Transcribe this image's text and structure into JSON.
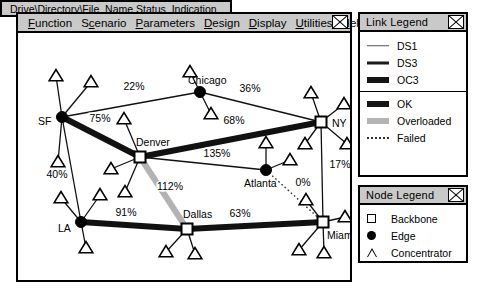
{
  "app": {
    "menu": [
      {
        "label": "Function",
        "accel": "F"
      },
      {
        "label": "Scenario",
        "accel": "c"
      },
      {
        "label": "Parameters",
        "accel": "P"
      },
      {
        "label": "Design",
        "accel": "D"
      },
      {
        "label": "Display",
        "accel": "D"
      },
      {
        "label": "Utilities",
        "accel": "U"
      },
      {
        "label": "Help",
        "accel": "H"
      }
    ],
    "close_icon": "close-x-icon"
  },
  "statusbar": {
    "text": "Drive\\Directory\\File_Name  Status_Indication"
  },
  "link_legend": {
    "title": "Link Legend",
    "close_icon": "close-x-icon",
    "capacity_items": [
      {
        "label": "DS1",
        "style": "ds1",
        "color": "#555555"
      },
      {
        "label": "DS3",
        "style": "ds3",
        "color": "#1a1a1a"
      },
      {
        "label": "OC3",
        "style": "oc3",
        "color": "#151515"
      }
    ],
    "status_items": [
      {
        "label": "OK",
        "style": "ok",
        "color": "#151515"
      },
      {
        "label": "Overloaded",
        "style": "over",
        "color": "#b3b3b3"
      },
      {
        "label": "Failed",
        "style": "fail",
        "color": "#333333"
      }
    ]
  },
  "node_legend": {
    "title": "Node Legend",
    "close_icon": "close-x-icon",
    "items": [
      {
        "label": "Backbone",
        "shape": "square",
        "icon": "square-node-icon"
      },
      {
        "label": "Edge",
        "shape": "circle",
        "icon": "circle-node-icon"
      },
      {
        "label": "Concentrator",
        "shape": "triangle",
        "icon": "triangle-node-icon"
      }
    ]
  },
  "network": {
    "nodes": [
      {
        "id": "sf",
        "label": "SF",
        "type": "edge",
        "x": 44,
        "y": 103,
        "label_dx": -24,
        "label_dy": 8
      },
      {
        "id": "chicago",
        "label": "Chicago",
        "type": "edge",
        "x": 182,
        "y": 78,
        "label_dx": -12,
        "label_dy": -8
      },
      {
        "id": "ny",
        "label": "NY",
        "type": "backbone",
        "x": 303,
        "y": 108,
        "label_dx": 11,
        "label_dy": 5
      },
      {
        "id": "denver",
        "label": "Denver",
        "type": "backbone",
        "x": 122,
        "y": 143,
        "label_dx": -4,
        "label_dy": -11
      },
      {
        "id": "atlanta",
        "label": "Edge",
        "type": "edge",
        "x": 248,
        "y": 156,
        "label_dx": -22,
        "label_dy": 17
      },
      {
        "id": "dallas",
        "label": "Dallas",
        "type": "backbone",
        "x": 169,
        "y": 215,
        "label_dx": -4,
        "label_dy": -11
      },
      {
        "id": "la",
        "label": "LA",
        "type": "edge",
        "x": 63,
        "y": 208,
        "label_dx": -23,
        "label_dy": 10
      },
      {
        "id": "miami",
        "label": "Miami",
        "type": "backbone",
        "x": 305,
        "y": 208,
        "label_dx": 4,
        "label_dy": 17
      }
    ],
    "node_labels": {
      "sf": "SF",
      "chicago": "Chicago",
      "ny": "NY",
      "denver": "Denver",
      "atlanta": "Atlanta",
      "dallas": "Dallas",
      "la": "LA",
      "miami": "Miami"
    },
    "links": [
      {
        "from": "sf",
        "to": "chicago",
        "utilization": "22%",
        "status": "ok",
        "capacity": "ds1",
        "lx": 116,
        "ly": 76
      },
      {
        "from": "chicago",
        "to": "ny",
        "utilization": "36%",
        "status": "ok",
        "capacity": "ds1",
        "lx": 232,
        "ly": 78
      },
      {
        "from": "sf",
        "to": "denver",
        "utilization": "75%",
        "status": "ok",
        "capacity": "oc3",
        "lx": 82,
        "ly": 108
      },
      {
        "from": "denver",
        "to": "ny",
        "utilization": "68%",
        "status": "ok",
        "capacity": "oc3",
        "lx": 216,
        "ly": 110
      },
      {
        "from": "sf",
        "to": "la",
        "utilization": "40%",
        "status": "ok",
        "capacity": "ds1",
        "lx": 39,
        "ly": 164
      },
      {
        "from": "denver",
        "to": "atlanta",
        "utilization": "135%",
        "status": "ok",
        "capacity": "ds1",
        "lx": 199,
        "ly": 143
      },
      {
        "from": "denver",
        "to": "dallas",
        "utilization": "112%",
        "status": "overloaded",
        "capacity": "oc3",
        "lx": 152,
        "ly": 176
      },
      {
        "from": "la",
        "to": "dallas",
        "utilization": "91%",
        "status": "ok",
        "capacity": "oc3",
        "lx": 108,
        "ly": 202
      },
      {
        "from": "dallas",
        "to": "miami",
        "utilization": "63%",
        "status": "ok",
        "capacity": "oc3",
        "lx": 222,
        "ly": 203
      },
      {
        "from": "ny",
        "to": "miami",
        "utilization": "17%",
        "status": "ok",
        "capacity": "ds1",
        "lx": 322,
        "ly": 154
      },
      {
        "from": "atlanta",
        "to": "miami",
        "utilization": "0%",
        "status": "failed",
        "capacity": "failed",
        "lx": 285,
        "ly": 172
      }
    ],
    "concentrators": [
      {
        "parent": "sf",
        "x": 38,
        "y": 62
      },
      {
        "parent": "sf",
        "x": 73,
        "y": 68
      },
      {
        "parent": "sf",
        "x": 40,
        "y": 148
      },
      {
        "parent": "chicago",
        "x": 172,
        "y": 58
      },
      {
        "parent": "chicago",
        "x": 193,
        "y": 100
      },
      {
        "parent": "denver",
        "x": 106,
        "y": 105
      },
      {
        "parent": "denver",
        "x": 93,
        "y": 155
      },
      {
        "parent": "denver",
        "x": 107,
        "y": 178
      },
      {
        "parent": "ny",
        "x": 293,
        "y": 79
      },
      {
        "parent": "ny",
        "x": 326,
        "y": 90
      },
      {
        "parent": "ny",
        "x": 287,
        "y": 130
      },
      {
        "parent": "ny",
        "x": 329,
        "y": 130
      },
      {
        "parent": "atlanta",
        "x": 248,
        "y": 129
      },
      {
        "parent": "atlanta",
        "x": 272,
        "y": 146
      },
      {
        "parent": "dallas",
        "x": 148,
        "y": 238
      },
      {
        "parent": "dallas",
        "x": 177,
        "y": 240
      },
      {
        "parent": "la",
        "x": 43,
        "y": 184
      },
      {
        "parent": "la",
        "x": 82,
        "y": 181
      },
      {
        "parent": "la",
        "x": 68,
        "y": 234
      },
      {
        "parent": "miami",
        "x": 288,
        "y": 186
      },
      {
        "parent": "miami",
        "x": 327,
        "y": 203
      },
      {
        "parent": "miami",
        "x": 281,
        "y": 236
      },
      {
        "parent": "miami",
        "x": 306,
        "y": 239
      }
    ]
  }
}
